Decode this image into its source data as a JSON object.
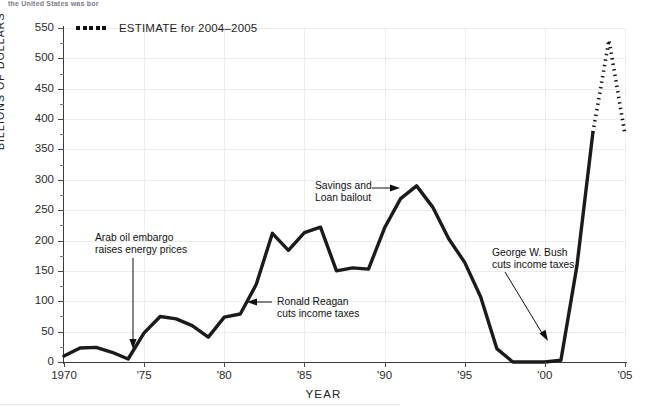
{
  "page": {
    "cut_off_top_text": "the United States was bor"
  },
  "legend": {
    "marker": "dotted-line-marker",
    "label": "ESTIMATE for 2004–2005"
  },
  "axes": {
    "y_title": "BILLIONS OF DOLLARS",
    "x_title": "YEAR",
    "y_ticks": [
      0,
      50,
      100,
      150,
      200,
      250,
      300,
      350,
      400,
      450,
      500,
      550
    ],
    "x_ticks": [
      {
        "value": 1970,
        "label": "1970"
      },
      {
        "value": 1975,
        "label": "'75"
      },
      {
        "value": 1980,
        "label": "'80"
      },
      {
        "value": 1985,
        "label": "'85"
      },
      {
        "value": 1990,
        "label": "'90"
      },
      {
        "value": 1995,
        "label": "'95"
      },
      {
        "value": 2000,
        "label": "'00"
      },
      {
        "value": 2005,
        "label": "'05"
      }
    ]
  },
  "annotations": [
    {
      "id": "arab-oil-embargo",
      "line1": "Arab oil embargo",
      "line2": "raises energy prices"
    },
    {
      "id": "ronald-reagan",
      "line1": "Ronald Reagan",
      "line2": "cuts income taxes"
    },
    {
      "id": "savings-loan",
      "line1": "Savings and",
      "line2": "Loan bailout"
    },
    {
      "id": "george-w-bush",
      "line1": "George W. Bush",
      "line2": "cuts income taxes"
    }
  ],
  "chart_data": {
    "type": "line",
    "title": "",
    "xlabel": "YEAR",
    "ylabel": "BILLIONS OF DOLLARS",
    "xlim": [
      1970,
      2005
    ],
    "ylim": [
      0,
      550
    ],
    "grid": true,
    "legend_position": "top-left",
    "series": [
      {
        "name": "Actual",
        "style": "solid",
        "color": "#1b1b1b",
        "x": [
          1970,
          1971,
          1972,
          1973,
          1974,
          1975,
          1976,
          1977,
          1978,
          1979,
          1980,
          1981,
          1982,
          1983,
          1984,
          1985,
          1986,
          1987,
          1988,
          1989,
          1990,
          1991,
          1992,
          1993,
          1994,
          1995,
          1996,
          1997,
          1998,
          1999,
          2000,
          2001,
          2002,
          2003
        ],
        "y": [
          10,
          23,
          24,
          16,
          5,
          48,
          75,
          71,
          60,
          41,
          74,
          79,
          128,
          212,
          184,
          213,
          222,
          150,
          155,
          153,
          221,
          269,
          290,
          255,
          203,
          164,
          107,
          22,
          0,
          0,
          0,
          3,
          158,
          378
        ]
      },
      {
        "name": "ESTIMATE for 2004–2005",
        "style": "dotted",
        "color": "#111111",
        "x": [
          2003,
          2004,
          2005
        ],
        "y": [
          378,
          530,
          375
        ]
      }
    ],
    "annotations": [
      {
        "text": "Arab oil embargo raises energy prices",
        "points_to_x": 1974,
        "points_to_y": 5
      },
      {
        "text": "Ronald Reagan cuts income taxes",
        "points_to_x": 1981,
        "points_to_y": 79
      },
      {
        "text": "Savings and Loan bailout",
        "points_to_x": 1990,
        "points_to_y": 221
      },
      {
        "text": "George W. Bush cuts income taxes",
        "points_to_x": 2001,
        "points_to_y": 3
      }
    ]
  }
}
